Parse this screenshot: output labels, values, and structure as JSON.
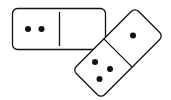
{
  "scene": {
    "description": "Two dominoes",
    "colors": {
      "background": "#ffffff",
      "stroke": "#111111",
      "pip": "#111111",
      "face": "#ffffff"
    }
  },
  "dominoes": [
    {
      "name": "horizontal-domino",
      "left_pips": 2,
      "right_pips": 0
    },
    {
      "name": "tilted-domino",
      "upper_pips": 1,
      "lower_pips": 3
    }
  ]
}
